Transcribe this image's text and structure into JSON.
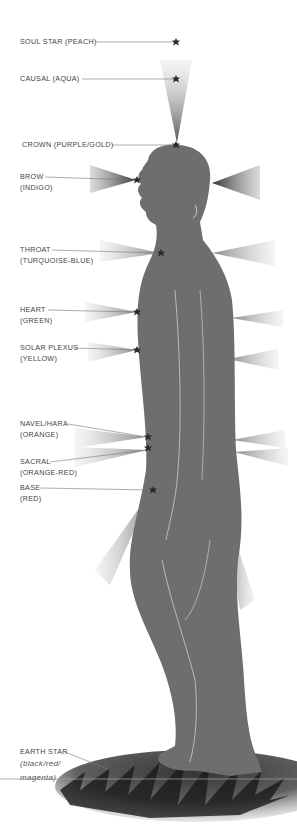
{
  "diagram": {
    "chakras": [
      {
        "id": "soul-star",
        "name": "SOUL STAR (PEACH)",
        "sub": ""
      },
      {
        "id": "causal",
        "name": "CAUSAL (AQUA)",
        "sub": ""
      },
      {
        "id": "crown",
        "name": "CROWN (PURPLE/GOLD)",
        "sub": ""
      },
      {
        "id": "brow",
        "name": "BROW",
        "sub": "(INDIGO)"
      },
      {
        "id": "throat",
        "name": "THROAT",
        "sub": "(TURQUOISE-BLUE)"
      },
      {
        "id": "heart",
        "name": "HEART",
        "sub": "(GREEN)"
      },
      {
        "id": "solar-plexus",
        "name": "SOLAR PLEXUS",
        "sub": "(YELLOW)"
      },
      {
        "id": "navel",
        "name": "NAVEL/HARA",
        "sub": "(ORANGE)"
      },
      {
        "id": "sacral",
        "name": "SACRAL",
        "sub": "(ORANGE-RED)"
      },
      {
        "id": "base",
        "name": "BASE",
        "sub": "(RED)"
      },
      {
        "id": "earth-star",
        "name": "EARTH STAR",
        "sub": "(black/red/",
        "sub2": "magenta)"
      }
    ],
    "colors": {
      "body": "#6e6e6e",
      "leader": "#777777",
      "star": "#2a2a2a",
      "text": "#444444"
    }
  }
}
